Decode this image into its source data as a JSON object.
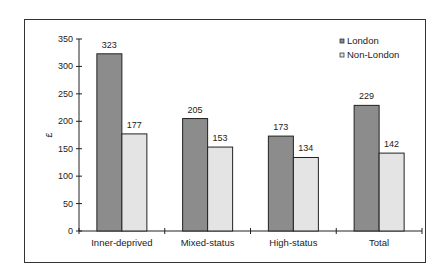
{
  "chart_data": {
    "type": "bar",
    "title": "",
    "xlabel": "",
    "ylabel": "£",
    "ylim": [
      0,
      350
    ],
    "yticks": [
      0,
      50,
      100,
      150,
      200,
      250,
      300,
      350
    ],
    "grid": false,
    "legend_position": "top-right",
    "categories": [
      "Inner-deprived",
      "Mixed-status",
      "High-status",
      "Total"
    ],
    "series": [
      {
        "name": "London",
        "color": "#8c8c8c",
        "values": [
          323,
          205,
          173,
          229
        ]
      },
      {
        "name": "Non-London",
        "color": "#e4e4e4",
        "values": [
          177,
          153,
          134,
          142
        ]
      }
    ]
  },
  "legend": {
    "items": [
      {
        "label": "London"
      },
      {
        "label": "Non-London"
      }
    ]
  },
  "axis": {
    "ylabel": "£",
    "yticks": [
      "0",
      "50",
      "100",
      "150",
      "200",
      "250",
      "300",
      "350"
    ],
    "categories": [
      "Inner-deprived",
      "Mixed-status",
      "High-status",
      "Total"
    ]
  },
  "labels": {
    "london": [
      "323",
      "205",
      "173",
      "229"
    ],
    "nonlondon": [
      "177",
      "153",
      "134",
      "142"
    ]
  }
}
